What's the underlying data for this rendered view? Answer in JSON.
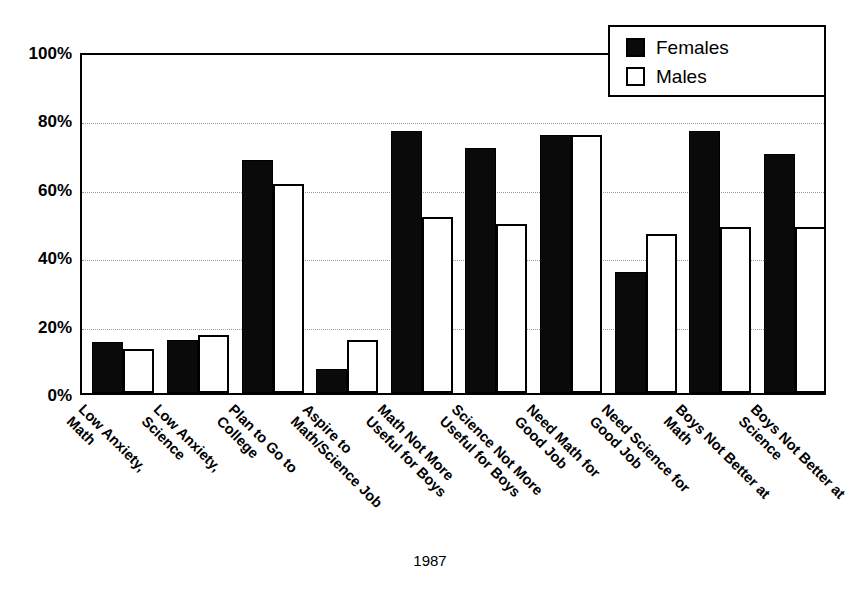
{
  "chart_data": {
    "type": "bar",
    "title": "",
    "xlabel": "1987",
    "ylabel": "",
    "ylim": [
      0,
      100
    ],
    "yticks": [
      "0%",
      "20%",
      "40%",
      "60%",
      "80%",
      "100%"
    ],
    "ytick_values": [
      0,
      20,
      40,
      60,
      80,
      100
    ],
    "grid": "horizontal dotted",
    "legend_position": "top-right",
    "categories": [
      "Low Anxiety, Math",
      "Low Anxiety, Science",
      "Plan to Go to College",
      "Aspire to Math/Science Job",
      "Math Not More Useful for Boys",
      "Science Not More Useful for Boys",
      "Need Math for Good Job",
      "Need Science for Good Job",
      "Boys Not Better at Math",
      "Boys Not Better at Science"
    ],
    "category_lines": [
      [
        "Low Anxiety,",
        "Math"
      ],
      [
        "Low Anxiety,",
        "Science"
      ],
      [
        "Plan to Go to",
        "College"
      ],
      [
        "Aspire to",
        "Math/Science Job"
      ],
      [
        "Math Not More",
        "Useful for Boys"
      ],
      [
        "Science Not More",
        "Useful for Boys"
      ],
      [
        "Need Math for",
        "Good Job"
      ],
      [
        "Need Science for",
        "Good Job"
      ],
      [
        "Boys Not Better at",
        "Math"
      ],
      [
        "Boys Not Better at",
        "Science"
      ]
    ],
    "series": [
      {
        "name": "Females",
        "color": "#0a0a0a",
        "values": [
          15,
          15.5,
          68,
          7,
          76.5,
          71.5,
          75.5,
          35.5,
          76.5,
          70
        ]
      },
      {
        "name": "Males",
        "color": "#ffffff",
        "values": [
          13,
          17,
          61,
          15.5,
          51.5,
          49.5,
          75.5,
          46.5,
          48.5,
          48.5
        ]
      }
    ]
  },
  "legend": {
    "items": [
      {
        "label": "Females",
        "style": "female"
      },
      {
        "label": "Males",
        "style": "male"
      }
    ]
  },
  "axis": {
    "x_title": "1987"
  }
}
